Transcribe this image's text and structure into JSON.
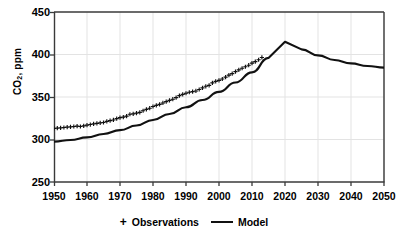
{
  "chart_data": {
    "type": "line",
    "title": "",
    "xlabel": "",
    "ylabel": "CO2, ppm",
    "ylabel_prefix": "CO",
    "ylabel_sub": "2",
    "ylabel_suffix": ", ppm",
    "xlim": [
      1950,
      2050
    ],
    "ylim": [
      250,
      450
    ],
    "xticks": [
      1950,
      1960,
      1970,
      1980,
      1990,
      2000,
      2010,
      2020,
      2030,
      2040,
      2050
    ],
    "yticks": [
      250,
      300,
      350,
      400,
      450
    ],
    "grid": true,
    "legend_position": "bottom-center",
    "series": [
      {
        "name": "Observations",
        "marker": "+",
        "style": "markers",
        "color": "#111111",
        "x": [
          1950,
          1951,
          1952,
          1953,
          1954,
          1955,
          1956,
          1957,
          1958,
          1959,
          1960,
          1961,
          1962,
          1963,
          1964,
          1965,
          1966,
          1967,
          1968,
          1969,
          1970,
          1971,
          1972,
          1973,
          1974,
          1975,
          1976,
          1977,
          1978,
          1979,
          1980,
          1981,
          1982,
          1983,
          1984,
          1985,
          1986,
          1987,
          1988,
          1989,
          1990,
          1991,
          1992,
          1993,
          1994,
          1995,
          1996,
          1997,
          1998,
          1999,
          2000,
          2001,
          2002,
          2003,
          2004,
          2005,
          2006,
          2007,
          2008,
          2009,
          2010,
          2011,
          2012,
          2013
        ],
        "values": [
          313.0,
          313.3,
          313.7,
          314.1,
          314.5,
          314.9,
          315.3,
          315.8,
          315.3,
          316.0,
          316.9,
          317.6,
          318.4,
          319.0,
          319.6,
          320.0,
          321.4,
          322.2,
          323.0,
          324.6,
          325.7,
          326.3,
          327.5,
          329.7,
          330.2,
          331.1,
          332.0,
          333.8,
          335.4,
          336.8,
          338.8,
          340.1,
          341.4,
          343.0,
          344.6,
          346.0,
          347.4,
          349.2,
          351.6,
          353.1,
          354.4,
          355.6,
          356.4,
          357.1,
          358.8,
          360.8,
          362.6,
          363.7,
          366.7,
          368.4,
          369.6,
          371.2,
          373.3,
          375.8,
          377.5,
          379.8,
          381.9,
          383.8,
          385.6,
          387.4,
          389.9,
          391.6,
          393.8,
          396.5
        ]
      },
      {
        "name": "Model",
        "marker": "none",
        "style": "line",
        "color": "#111111",
        "x": [
          1950,
          1955,
          1960,
          1965,
          1970,
          1975,
          1980,
          1985,
          1990,
          1995,
          2000,
          2005,
          2010,
          2015,
          2020,
          2025,
          2030,
          2035,
          2040,
          2045,
          2050
        ],
        "values": [
          297.5,
          299.5,
          302.5,
          306.5,
          311.0,
          316.5,
          323.0,
          330.0,
          338.0,
          346.5,
          356.0,
          367.0,
          379.0,
          396.0,
          415.0,
          406.0,
          399.0,
          393.5,
          389.5,
          386.5,
          384.5
        ]
      }
    ],
    "annotations": {
      "peak_year": 2020,
      "peak_value": 415
    }
  },
  "legend": {
    "observations_marker": "+",
    "observations_label": "Observations",
    "model_label": "Model"
  }
}
